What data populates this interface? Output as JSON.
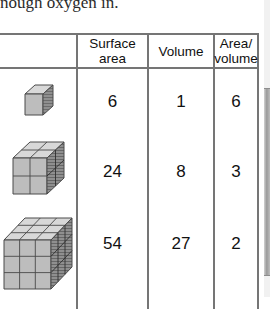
{
  "page": {
    "intro_text": "nough oxygen in.",
    "scrollbar": {
      "name": "vertical-scrollbar"
    }
  },
  "table": {
    "headers": [
      {
        "line1": "",
        "line2": ""
      },
      {
        "line1": "Surface",
        "line2": "area"
      },
      {
        "line1": "Volume",
        "line2": ""
      },
      {
        "line1": "Area/",
        "line2": "volume"
      }
    ],
    "rows": [
      {
        "figure": "cube-1x1x1",
        "edge": 1,
        "surface_area": "6",
        "volume": "1",
        "area_over_volume": "6"
      },
      {
        "figure": "cube-2x2x2",
        "edge": 2,
        "surface_area": "24",
        "volume": "8",
        "area_over_volume": "3"
      },
      {
        "figure": "cube-3x3x3",
        "edge": 3,
        "surface_area": "54",
        "volume": "27",
        "area_over_volume": "2"
      }
    ]
  },
  "colors": {
    "rule": "#757575",
    "text": "#111111",
    "cube_top_face": "#d8d8d8",
    "cube_front_face": "#bdbdbd",
    "cube_side_face": "#8f8f8f",
    "cube_outline": "#4a4a4a",
    "background": "#ffffff"
  }
}
